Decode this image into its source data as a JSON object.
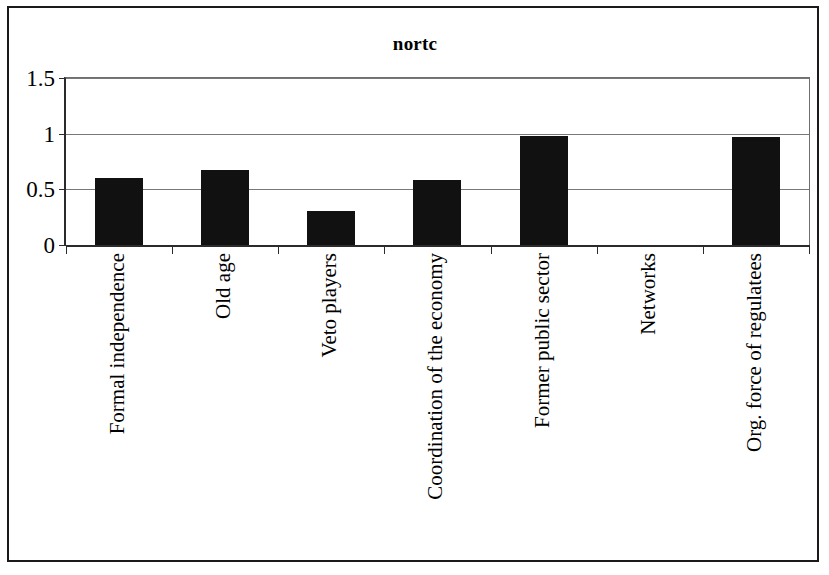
{
  "chart_data": {
    "type": "bar",
    "title": "nortc",
    "xlabel": "",
    "ylabel": "",
    "ylim": [
      0,
      1.5
    ],
    "yticks": [
      0,
      0.5,
      1,
      1.5
    ],
    "ytick_labels": [
      "0",
      "0.5",
      "1",
      "1.5"
    ],
    "grid": true,
    "legend": false,
    "orientation": "vertical",
    "bar_color": "#111111",
    "background_color": "#ffffff",
    "categories": [
      "Formal independence",
      "Old age",
      "Veto players",
      "Coordination of the economy",
      "Former public sector",
      "Networks",
      "Org. force of regulatees"
    ],
    "values": [
      0.6,
      0.67,
      0.31,
      0.58,
      0.98,
      0,
      0.97
    ]
  },
  "ylabels": [
    "1.5",
    "1",
    "0.5",
    "0"
  ]
}
